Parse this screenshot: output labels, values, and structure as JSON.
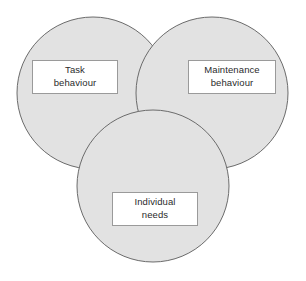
{
  "diagram": {
    "type": "venn-3-circle",
    "width": 306,
    "height": 281,
    "background_color": "#ffffff",
    "circle_fill_color": "#e2e2e2",
    "circle_stroke_color": "#6b6b6b",
    "label_box_fill": "#ffffff",
    "label_box_border": "#9a9a9a",
    "label_text_color": "#2b2b2b",
    "circles": [
      {
        "name": "task-behaviour-circle",
        "cx": 93,
        "cy": 93,
        "r": 76
      },
      {
        "name": "maintenance-behaviour-circle",
        "cx": 212,
        "cy": 93,
        "r": 76
      },
      {
        "name": "individual-needs-circle",
        "cx": 153,
        "cy": 186,
        "r": 76
      }
    ],
    "labels": {
      "task": {
        "line1": "Task",
        "line2": "behaviour"
      },
      "maintenance": {
        "line1": "Maintenance",
        "line2": "behaviour"
      },
      "individual": {
        "line1": "Individual",
        "line2": "needs"
      }
    }
  }
}
